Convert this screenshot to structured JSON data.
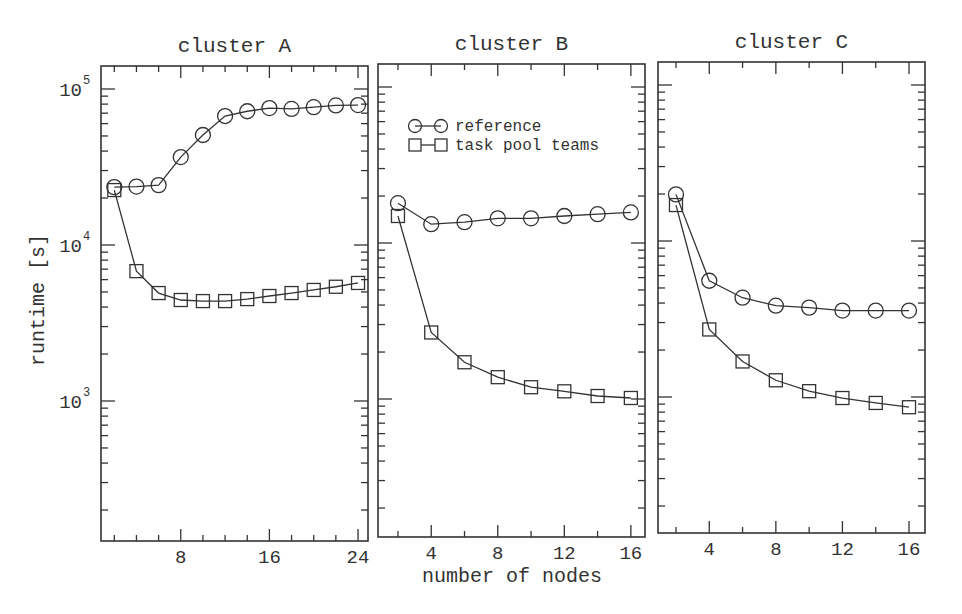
{
  "figure": {
    "ylabel": "runtime [s]",
    "xlabel": "number of nodes",
    "legend": {
      "entries": [
        {
          "label": "reference",
          "marker": "circle"
        },
        {
          "label": "task pool teams",
          "marker": "square"
        }
      ]
    },
    "y_tick_labels": [
      {
        "base": "10",
        "exp": "5",
        "value": 100000
      },
      {
        "base": "10",
        "exp": "4",
        "value": 10000
      },
      {
        "base": "10",
        "exp": "3",
        "value": 1000
      }
    ],
    "colors": {
      "ink": "#333333",
      "background": "#ffffff"
    }
  },
  "chart_data": [
    {
      "type": "line",
      "title": "cluster A",
      "xlabel": "number of nodes",
      "ylabel": "runtime [s]",
      "yscale": "log",
      "ylim": [
        130,
        140000
      ],
      "xlim": [
        0.8,
        24.9
      ],
      "xticks_major": [
        8,
        16,
        24
      ],
      "xticks_minor_step": 2,
      "grid": false,
      "legend_position": "none",
      "x": [
        2,
        4,
        6,
        8,
        10,
        12,
        14,
        16,
        18,
        20,
        22,
        24
      ],
      "series": [
        {
          "name": "reference",
          "marker": "circle",
          "values": [
            23500,
            23700,
            24200,
            36600,
            50700,
            67100,
            72000,
            75500,
            74500,
            76500,
            78500,
            78900
          ]
        },
        {
          "name": "task pool teams",
          "marker": "square",
          "values": [
            22500,
            6800,
            4920,
            4440,
            4370,
            4370,
            4500,
            4710,
            4920,
            5150,
            5400,
            5710
          ]
        }
      ]
    },
    {
      "type": "line",
      "title": "cluster B",
      "xlabel": "number of nodes",
      "ylabel": "runtime [s]",
      "yscale": "log",
      "ylim": [
        130,
        140000
      ],
      "xlim": [
        0.8,
        16.85
      ],
      "xticks_major": [
        4,
        8,
        12,
        16
      ],
      "xticks_minor_step": 2,
      "grid": false,
      "legend_position": "upper left",
      "x": [
        2,
        4,
        6,
        8,
        10,
        12,
        14,
        16
      ],
      "series": [
        {
          "name": "reference",
          "marker": "circle",
          "values": [
            18000,
            13200,
            13600,
            14400,
            14400,
            14900,
            15300,
            15700
          ]
        },
        {
          "name": "task pool teams",
          "marker": "square",
          "values": [
            14900,
            2670,
            1720,
            1380,
            1190,
            1120,
            1045,
            1015
          ]
        }
      ]
    },
    {
      "type": "line",
      "title": "cluster C",
      "xlabel": "number of nodes",
      "ylabel": "runtime [s]",
      "yscale": "log",
      "ylim": [
        130,
        140000
      ],
      "xlim": [
        0.92,
        16.96
      ],
      "xticks_major": [
        4,
        8,
        12,
        16
      ],
      "xticks_minor_step": 2,
      "grid": false,
      "legend_position": "none",
      "x": [
        2,
        4,
        6,
        8,
        10,
        12,
        14,
        16
      ],
      "series": [
        {
          "name": "reference",
          "marker": "circle",
          "values": [
            19900,
            5560,
            4330,
            3850,
            3740,
            3580,
            3580,
            3580
          ]
        },
        {
          "name": "task pool teams",
          "marker": "square",
          "values": [
            17000,
            2710,
            1690,
            1280,
            1090,
            985,
            916,
            860
          ]
        }
      ]
    }
  ]
}
